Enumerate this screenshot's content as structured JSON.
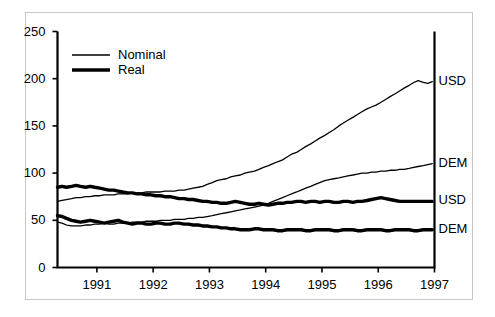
{
  "chart_data": {
    "type": "line",
    "title": "",
    "subtitle": "",
    "xlabel": "",
    "ylabel": "",
    "xlim": [
      1990.3,
      1997.0
    ],
    "ylim": [
      0,
      250
    ],
    "grid": false,
    "legend_position": "top-left",
    "y_ticks": [
      0,
      50,
      100,
      150,
      200,
      250
    ],
    "y_tick_labels": [
      "0",
      "50",
      "100",
      "150",
      "200",
      "250"
    ],
    "x_ticks": [
      1991,
      1992,
      1993,
      1994,
      1995,
      1996,
      1997
    ],
    "x_tick_labels": [
      "1991",
      "1992",
      "1993",
      "1994",
      "1995",
      "1996",
      "1997"
    ],
    "legend": [
      {
        "label": "Nominal",
        "style": "thin"
      },
      {
        "label": "Real",
        "style": "thick"
      }
    ],
    "end_labels": [
      {
        "text": "USD",
        "value": 197
      },
      {
        "text": "DEM",
        "value": 110
      },
      {
        "text": "USD",
        "value": 70
      },
      {
        "text": "DEM",
        "value": 40
      }
    ],
    "series": [
      {
        "name": "Nominal USD",
        "style": "thin",
        "end_label": "USD",
        "x": [
          1990.3,
          1990.38,
          1990.46,
          1990.55,
          1990.63,
          1990.71,
          1990.8,
          1990.88,
          1990.96,
          1991.05,
          1991.13,
          1991.21,
          1991.3,
          1991.38,
          1991.46,
          1991.55,
          1991.63,
          1991.71,
          1991.8,
          1991.88,
          1991.96,
          1992.05,
          1992.13,
          1992.21,
          1992.3,
          1992.38,
          1992.46,
          1992.55,
          1992.63,
          1992.71,
          1992.8,
          1992.88,
          1992.96,
          1993.05,
          1993.13,
          1993.21,
          1993.3,
          1993.38,
          1993.46,
          1993.55,
          1993.63,
          1993.71,
          1993.8,
          1993.88,
          1993.96,
          1994.05,
          1994.13,
          1994.21,
          1994.3,
          1994.38,
          1994.46,
          1994.55,
          1994.63,
          1994.71,
          1994.8,
          1994.88,
          1994.96,
          1995.05,
          1995.13,
          1995.21,
          1995.3,
          1995.38,
          1995.46,
          1995.55,
          1995.63,
          1995.71,
          1995.8,
          1995.88,
          1995.96,
          1996.05,
          1996.13,
          1996.21,
          1996.3,
          1996.38,
          1996.46,
          1996.55,
          1996.63,
          1996.71,
          1996.8,
          1996.88,
          1996.96
        ],
        "y": [
          70,
          71,
          72,
          73,
          74,
          74,
          75,
          75,
          76,
          76,
          77,
          77,
          77,
          78,
          78,
          78,
          79,
          79,
          79,
          80,
          80,
          80,
          80,
          81,
          81,
          81,
          82,
          82,
          83,
          84,
          85,
          86,
          88,
          90,
          92,
          93,
          94,
          96,
          97,
          98,
          100,
          101,
          102,
          104,
          106,
          108,
          110,
          112,
          114,
          117,
          120,
          122,
          125,
          128,
          131,
          134,
          137,
          140,
          143,
          146,
          150,
          153,
          156,
          159,
          162,
          165,
          168,
          170,
          172,
          175,
          178,
          181,
          184,
          187,
          190,
          193,
          196,
          198,
          196,
          195,
          197
        ]
      },
      {
        "name": "Nominal DEM",
        "style": "thin",
        "end_label": "DEM",
        "x": [
          1990.3,
          1990.38,
          1990.46,
          1990.55,
          1990.63,
          1990.71,
          1990.8,
          1990.88,
          1990.96,
          1991.05,
          1991.13,
          1991.21,
          1991.3,
          1991.38,
          1991.46,
          1991.55,
          1991.63,
          1991.71,
          1991.8,
          1991.88,
          1991.96,
          1992.05,
          1992.13,
          1992.21,
          1992.3,
          1992.38,
          1992.46,
          1992.55,
          1992.63,
          1992.71,
          1992.8,
          1992.88,
          1992.96,
          1993.05,
          1993.13,
          1993.21,
          1993.3,
          1993.38,
          1993.46,
          1993.55,
          1993.63,
          1993.71,
          1993.8,
          1993.88,
          1993.96,
          1994.05,
          1994.13,
          1994.21,
          1994.3,
          1994.38,
          1994.46,
          1994.55,
          1994.63,
          1994.71,
          1994.8,
          1994.88,
          1994.96,
          1995.05,
          1995.13,
          1995.21,
          1995.3,
          1995.38,
          1995.46,
          1995.55,
          1995.63,
          1995.71,
          1995.8,
          1995.88,
          1995.96,
          1996.05,
          1996.13,
          1996.21,
          1996.3,
          1996.38,
          1996.46,
          1996.55,
          1996.63,
          1996.71,
          1996.8,
          1996.88,
          1996.96
        ],
        "y": [
          48,
          47,
          45,
          44,
          44,
          44,
          45,
          45,
          46,
          46,
          47,
          46,
          46,
          47,
          47,
          47,
          48,
          48,
          48,
          49,
          49,
          49,
          50,
          50,
          50,
          51,
          51,
          51,
          52,
          52,
          53,
          53,
          54,
          55,
          56,
          57,
          58,
          59,
          60,
          61,
          62,
          63,
          64,
          65,
          66,
          68,
          70,
          72,
          74,
          76,
          78,
          80,
          82,
          84,
          86,
          88,
          90,
          92,
          93,
          94,
          95,
          96,
          97,
          98,
          99,
          100,
          100,
          101,
          101,
          102,
          102,
          103,
          103,
          104,
          104,
          105,
          106,
          107,
          108,
          109,
          110
        ]
      },
      {
        "name": "Real USD",
        "style": "thick",
        "end_label": "USD",
        "x": [
          1990.3,
          1990.38,
          1990.46,
          1990.55,
          1990.63,
          1990.71,
          1990.8,
          1990.88,
          1990.96,
          1991.05,
          1991.13,
          1991.21,
          1991.3,
          1991.38,
          1991.46,
          1991.55,
          1991.63,
          1991.71,
          1991.8,
          1991.88,
          1991.96,
          1992.05,
          1992.13,
          1992.21,
          1992.3,
          1992.38,
          1992.46,
          1992.55,
          1992.63,
          1992.71,
          1992.8,
          1992.88,
          1992.96,
          1993.05,
          1993.13,
          1993.21,
          1993.3,
          1993.38,
          1993.46,
          1993.55,
          1993.63,
          1993.71,
          1993.8,
          1993.88,
          1993.96,
          1994.05,
          1994.13,
          1994.21,
          1994.3,
          1994.38,
          1994.46,
          1994.55,
          1994.63,
          1994.71,
          1994.8,
          1994.88,
          1994.96,
          1995.05,
          1995.13,
          1995.21,
          1995.3,
          1995.38,
          1995.46,
          1995.55,
          1995.63,
          1995.71,
          1995.8,
          1995.88,
          1995.96,
          1996.05,
          1996.13,
          1996.21,
          1996.3,
          1996.38,
          1996.46,
          1996.55,
          1996.63,
          1996.71,
          1996.8,
          1996.88,
          1996.96
        ],
        "y": [
          85,
          86,
          85,
          86,
          87,
          86,
          85,
          86,
          85,
          84,
          83,
          82,
          82,
          81,
          80,
          79,
          79,
          78,
          78,
          77,
          77,
          76,
          76,
          75,
          75,
          74,
          73,
          73,
          72,
          72,
          71,
          70,
          70,
          69,
          69,
          68,
          68,
          69,
          70,
          69,
          68,
          67,
          67,
          68,
          67,
          66,
          67,
          68,
          68,
          69,
          69,
          70,
          70,
          69,
          70,
          70,
          69,
          70,
          70,
          69,
          69,
          70,
          70,
          69,
          70,
          70,
          71,
          72,
          73,
          74,
          73,
          72,
          71,
          70,
          70,
          70,
          70,
          70,
          70,
          70,
          70
        ]
      },
      {
        "name": "Real DEM",
        "style": "thick",
        "end_label": "DEM",
        "x": [
          1990.3,
          1990.38,
          1990.46,
          1990.55,
          1990.63,
          1990.71,
          1990.8,
          1990.88,
          1990.96,
          1991.05,
          1991.13,
          1991.21,
          1991.3,
          1991.38,
          1991.46,
          1991.55,
          1991.63,
          1991.71,
          1991.8,
          1991.88,
          1991.96,
          1992.05,
          1992.13,
          1992.21,
          1992.3,
          1992.38,
          1992.46,
          1992.55,
          1992.63,
          1992.71,
          1992.8,
          1992.88,
          1992.96,
          1993.05,
          1993.13,
          1993.21,
          1993.3,
          1993.38,
          1993.46,
          1993.55,
          1993.63,
          1993.71,
          1993.8,
          1993.88,
          1993.96,
          1994.05,
          1994.13,
          1994.21,
          1994.3,
          1994.38,
          1994.46,
          1994.55,
          1994.63,
          1994.71,
          1994.8,
          1994.88,
          1994.96,
          1995.05,
          1995.13,
          1995.21,
          1995.3,
          1995.38,
          1995.46,
          1995.55,
          1995.63,
          1995.71,
          1995.8,
          1995.88,
          1995.96,
          1996.05,
          1996.13,
          1996.21,
          1996.3,
          1996.38,
          1996.46,
          1996.55,
          1996.63,
          1996.71,
          1996.8,
          1996.88,
          1996.96
        ],
        "y": [
          55,
          54,
          52,
          50,
          49,
          48,
          49,
          50,
          49,
          48,
          47,
          48,
          49,
          50,
          48,
          47,
          46,
          47,
          47,
          46,
          46,
          47,
          47,
          46,
          46,
          47,
          47,
          46,
          46,
          45,
          45,
          44,
          44,
          43,
          43,
          42,
          42,
          41,
          41,
          40,
          40,
          40,
          41,
          41,
          40,
          40,
          40,
          39,
          39,
          40,
          40,
          40,
          40,
          39,
          39,
          40,
          40,
          40,
          40,
          39,
          39,
          40,
          40,
          40,
          39,
          39,
          40,
          40,
          40,
          40,
          39,
          39,
          40,
          40,
          40,
          40,
          39,
          39,
          40,
          40,
          40
        ]
      }
    ]
  },
  "colors": {
    "line": "#000000",
    "axis": "#000000",
    "frame": "#c8c8c8",
    "background": "#ffffff"
  }
}
